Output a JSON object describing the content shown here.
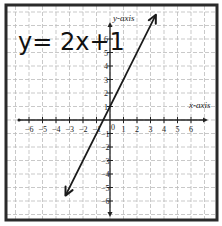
{
  "chart_data": {
    "type": "line",
    "title": "y= 2x+1",
    "equation": {
      "slope": 2,
      "intercept": 1
    },
    "xlabel": "x-axis",
    "ylabel": "y-axis",
    "xlim": [
      -7,
      7
    ],
    "ylim": [
      -7,
      7
    ],
    "x_ticks": [
      -6,
      -5,
      -4,
      -3,
      -2,
      -1,
      1,
      2,
      3,
      4,
      5,
      6
    ],
    "y_ticks": [
      6,
      5,
      4,
      3,
      2,
      1,
      -1,
      -2,
      -3,
      -4,
      -5,
      -6
    ],
    "origin_label": "0",
    "grid": true,
    "grid_style": "dashed",
    "series": [
      {
        "name": "y=2x+1",
        "x": [
          -3.3,
          3.4
        ],
        "y": [
          -5.6,
          7.8
        ],
        "arrows": "both"
      }
    ],
    "colors": {
      "line": "#1a1a1a",
      "grid": "#bbbbbb",
      "frame": "#2a2a2a"
    }
  }
}
